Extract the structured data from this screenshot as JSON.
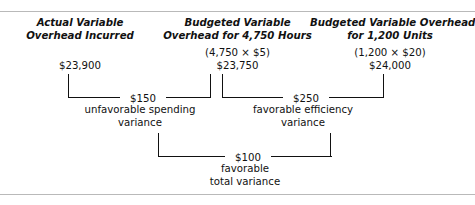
{
  "title": "Variable Overhead Variances",
  "columns": [
    {
      "heading_line1": "Actual Variable",
      "heading_line2": "Overhead Incurred",
      "formula": "",
      "amount": "$23,900"
    },
    {
      "heading_line1": "Budgeted Variable",
      "heading_line2": "Overhead for 4,750 Hours",
      "formula": "(4,750 × $5)",
      "amount": "$23,750"
    },
    {
      "heading_line1": "Budgeted Variable Overhead",
      "heading_line2": "for 1,200 Units",
      "formula": "(1,200 × $20)",
      "amount": "$24,000"
    }
  ],
  "variances": [
    {
      "value": "$150",
      "caption_line1": "unfavorable spending",
      "caption_line2": "variance"
    },
    {
      "value": "$250",
      "caption_line1": "favorable efficiency",
      "caption_line2": "variance"
    },
    {
      "value": "$100",
      "caption_line1": "favorable",
      "caption_line2": "total variance"
    }
  ],
  "colors": {
    "ink": "#111111",
    "rule": "#b9b9b9",
    "background": "#ffffff"
  }
}
